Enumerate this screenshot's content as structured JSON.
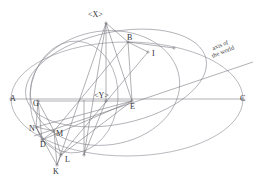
{
  "figure": {
    "title": "",
    "domain": "geometric-astronomical-diagram",
    "canvas": {
      "width": 262,
      "height": 185,
      "background": "#ffffff"
    },
    "stroke_color": "#8a8a93",
    "stroke_color_dark": "#6f6f78",
    "label_color": "#2e2e33",
    "annotations": [
      {
        "name": "axis-of-the-world",
        "line1": "axis of",
        "line2": "the world",
        "x": 221,
        "y": 47,
        "rotation": -22
      }
    ],
    "points": [
      {
        "id": "A",
        "label": "A",
        "x": 11,
        "y": 99,
        "lx": 10,
        "ly": 101
      },
      {
        "id": "B",
        "label": "B",
        "x": 128,
        "y": 42,
        "lx": 127,
        "ly": 40
      },
      {
        "id": "C",
        "label": "C",
        "x": 243,
        "y": 99,
        "lx": 240,
        "ly": 101
      },
      {
        "id": "D",
        "label": "D",
        "x": 42,
        "y": 140,
        "lx": 40,
        "ly": 147
      },
      {
        "id": "E",
        "label": "E",
        "x": 132,
        "y": 101,
        "lx": 130,
        "ly": 109
      },
      {
        "id": "G",
        "label": "G",
        "x": 38,
        "y": 101,
        "lx": 33,
        "ly": 106
      },
      {
        "id": "I",
        "label": "I",
        "x": 148,
        "y": 52,
        "lx": 152,
        "ly": 56
      },
      {
        "id": "K",
        "label": "K",
        "x": 57,
        "y": 165,
        "lx": 53,
        "ly": 174
      },
      {
        "id": "L",
        "label": "L",
        "x": 61,
        "y": 155,
        "lx": 65,
        "ly": 162
      },
      {
        "id": "M",
        "label": "M",
        "x": 54,
        "y": 131,
        "lx": 56,
        "ly": 136
      },
      {
        "id": "N",
        "label": "N",
        "x": 36,
        "y": 127,
        "lx": 29,
        "ly": 131
      },
      {
        "id": "X",
        "label": "<X>",
        "x": 106,
        "y": 23,
        "lx": 88,
        "ly": 17
      },
      {
        "id": "Y",
        "label": "<Y>",
        "x": 106,
        "y": 101,
        "lx": 94,
        "ly": 98
      }
    ],
    "vertex_markers": [
      {
        "name": "vertex-A",
        "x": 11,
        "y": 99
      },
      {
        "name": "vertex-B",
        "x": 128,
        "y": 42
      },
      {
        "name": "vertex-C",
        "x": 243,
        "y": 99
      },
      {
        "name": "vertex-D",
        "x": 42,
        "y": 140
      },
      {
        "name": "vertex-E",
        "x": 132,
        "y": 101
      },
      {
        "name": "vertex-G",
        "x": 38,
        "y": 101
      },
      {
        "name": "vertex-I",
        "x": 148,
        "y": 52
      },
      {
        "name": "vertex-K",
        "x": 57,
        "y": 165
      },
      {
        "name": "vertex-L",
        "x": 61,
        "y": 155
      },
      {
        "name": "vertex-M",
        "x": 54,
        "y": 131
      },
      {
        "name": "vertex-N",
        "x": 36,
        "y": 127
      },
      {
        "name": "vertex-X",
        "x": 106,
        "y": 23
      },
      {
        "name": "vertex-Y",
        "x": 106,
        "y": 101
      },
      {
        "name": "vertex-right-arc",
        "x": 174,
        "y": 48
      },
      {
        "name": "vertex-bottom",
        "x": 84,
        "y": 155
      }
    ],
    "ellipses": [
      {
        "name": "main-horizon-ellipse",
        "cx": 127,
        "cy": 99,
        "rx": 116,
        "ry": 57,
        "rot": 0
      },
      {
        "name": "meridian-ellipse",
        "cx": 105,
        "cy": 88,
        "rx": 75,
        "ry": 57,
        "rot": -8
      },
      {
        "name": "equator-ellipse",
        "cx": 116,
        "cy": 78,
        "rx": 92,
        "ry": 46,
        "rot": -12
      },
      {
        "name": "small-circle-ellipse",
        "cx": 74,
        "cy": 97,
        "rx": 44,
        "ry": 56,
        "rot": 4
      }
    ],
    "straight_lines": [
      {
        "name": "line-A-C",
        "x1": 11,
        "y1": 99,
        "x2": 243,
        "y2": 99
      },
      {
        "name": "line-axis-of-world",
        "x1": 34,
        "y1": 136,
        "x2": 253,
        "y2": 62
      },
      {
        "name": "line-X-E",
        "x1": 106,
        "y1": 23,
        "x2": 132,
        "y2": 101
      },
      {
        "name": "line-X-B",
        "x1": 106,
        "y1": 23,
        "x2": 128,
        "y2": 42
      },
      {
        "name": "line-X-Y",
        "x1": 106,
        "y1": 23,
        "x2": 106,
        "y2": 101
      },
      {
        "name": "line-X-K",
        "x1": 106,
        "y1": 23,
        "x2": 57,
        "y2": 165
      },
      {
        "name": "line-X-bot",
        "x1": 106,
        "y1": 23,
        "x2": 84,
        "y2": 155
      },
      {
        "name": "line-B-I",
        "x1": 128,
        "y1": 42,
        "x2": 148,
        "y2": 52
      },
      {
        "name": "line-B-E",
        "x1": 128,
        "y1": 42,
        "x2": 132,
        "y2": 101
      },
      {
        "name": "line-B-M",
        "x1": 128,
        "y1": 42,
        "x2": 54,
        "y2": 131
      },
      {
        "name": "line-B-arc",
        "x1": 128,
        "y1": 42,
        "x2": 174,
        "y2": 48
      },
      {
        "name": "line-I-L",
        "x1": 148,
        "y1": 52,
        "x2": 61,
        "y2": 155
      },
      {
        "name": "line-E-N",
        "x1": 132,
        "y1": 101,
        "x2": 36,
        "y2": 127
      },
      {
        "name": "line-E-D",
        "x1": 132,
        "y1": 101,
        "x2": 42,
        "y2": 140
      },
      {
        "name": "line-E-G",
        "x1": 132,
        "y1": 101,
        "x2": 38,
        "y2": 101
      },
      {
        "name": "line-G-N",
        "x1": 38,
        "y1": 101,
        "x2": 36,
        "y2": 127
      },
      {
        "name": "line-G-M",
        "x1": 38,
        "y1": 101,
        "x2": 54,
        "y2": 131
      },
      {
        "name": "line-G-D",
        "x1": 38,
        "y1": 101,
        "x2": 42,
        "y2": 140
      },
      {
        "name": "line-N-M",
        "x1": 36,
        "y1": 127,
        "x2": 54,
        "y2": 131
      },
      {
        "name": "line-N-D",
        "x1": 36,
        "y1": 127,
        "x2": 42,
        "y2": 140
      },
      {
        "name": "line-N-K",
        "x1": 36,
        "y1": 127,
        "x2": 57,
        "y2": 165
      },
      {
        "name": "line-M-D",
        "x1": 54,
        "y1": 131,
        "x2": 42,
        "y2": 140
      },
      {
        "name": "line-M-K",
        "x1": 54,
        "y1": 131,
        "x2": 57,
        "y2": 165
      },
      {
        "name": "line-M-L",
        "x1": 54,
        "y1": 131,
        "x2": 61,
        "y2": 155
      },
      {
        "name": "line-D-L",
        "x1": 42,
        "y1": 140,
        "x2": 61,
        "y2": 155
      },
      {
        "name": "line-K-L",
        "x1": 57,
        "y1": 165,
        "x2": 61,
        "y2": 155
      },
      {
        "name": "line-Y-bot",
        "x1": 106,
        "y1": 101,
        "x2": 84,
        "y2": 155
      },
      {
        "name": "line-bot-vert",
        "x1": 84,
        "y1": 100,
        "x2": 84,
        "y2": 155
      },
      {
        "name": "line-E-L",
        "x1": 132,
        "y1": 101,
        "x2": 61,
        "y2": 155
      }
    ]
  }
}
